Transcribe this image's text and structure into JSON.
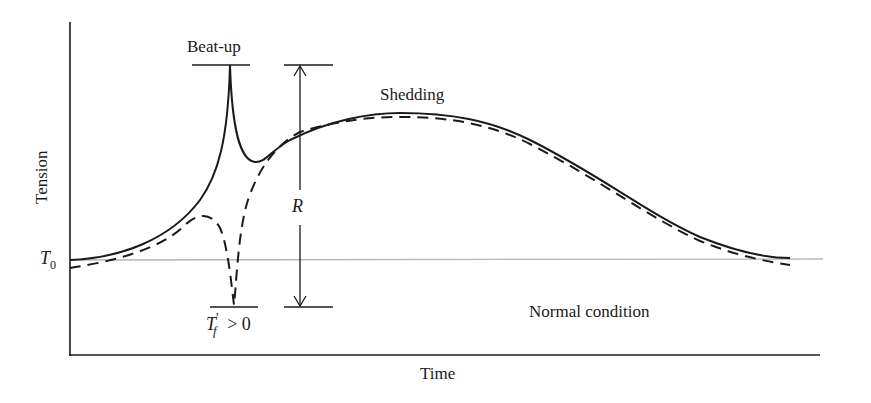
{
  "diagram": {
    "type": "tension-time curve",
    "axes": {
      "x_label": "Time",
      "y_label": "Tension"
    },
    "baseline": {
      "label_main": "T",
      "label_sub": "0",
      "color": "#b5b5b5"
    },
    "annotations": {
      "beat_up": "Beat-up",
      "shedding": "Shedding",
      "range": "R",
      "tf_main": "T",
      "tf_prime": "′",
      "tf_sub": "f",
      "tf_condition": " > 0",
      "normal_condition": "Normal condition"
    },
    "curves": [
      {
        "name": "solid",
        "style": "solid",
        "color": "#1a1a1a"
      },
      {
        "name": "dashed",
        "style": "dashed",
        "color": "#1a1a1a"
      }
    ]
  }
}
